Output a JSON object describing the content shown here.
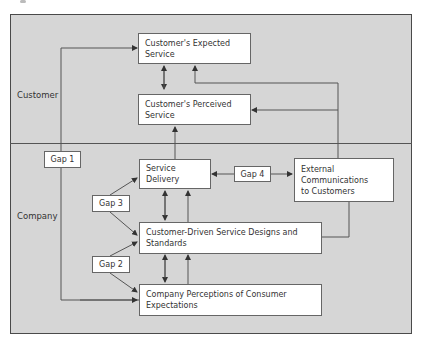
{
  "diagram": {
    "type": "gaps-model",
    "regions": {
      "customer": {
        "label": "Customer"
      },
      "company": {
        "label": "Company"
      }
    },
    "boxes": {
      "expected_service": "Customer's Expected Service",
      "perceived_service": "Customer's Perceived Service",
      "service_delivery": "Service Delivery",
      "external_communications_line1": "External Communications",
      "external_communications_line2": "to Customers",
      "service_designs": "Customer-Driven Service Designs and Standards",
      "company_perceptions": "Company Perceptions of Consumer Expectations"
    },
    "gaps": {
      "gap1": "Gap 1",
      "gap2": "Gap 2",
      "gap3": "Gap 3",
      "gap4": "Gap 4"
    },
    "colors": {
      "background": "#d6d6d6",
      "box": "#ffffff",
      "line": "#555555"
    }
  }
}
